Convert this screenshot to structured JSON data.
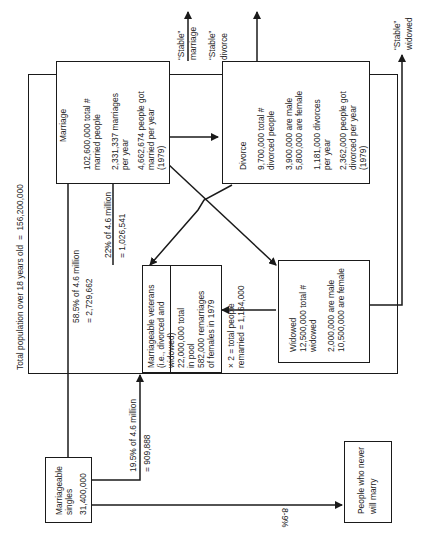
{
  "diagram": {
    "outer_label": "Total population over 18 years old  =  156,200,000",
    "stable": {
      "marriage": [
        "“Stable”",
        "marriage"
      ],
      "divorce": [
        "“Stable”",
        "divorce"
      ],
      "widowed": [
        "“Stable”",
        "widowed"
      ]
    },
    "marriage_box": {
      "title": "Marriage",
      "lines": [
        "102,600,000 total #",
        "married people",
        "2,331,337 marriages",
        "per year",
        "4,662,674 people got",
        "married per year",
        "(1979)"
      ]
    },
    "divorce_box": {
      "title": "Divorce",
      "lines": [
        "9,700,000 total #",
        "divorced people",
        "3,900,000 are male",
        "5,800,000 are female",
        "1,181,000 divorces",
        "per year",
        "2,362,000 people got",
        "divorced per year",
        "(1979)"
      ]
    },
    "veterans_box": {
      "title": "Marriageable veterans",
      "lines": [
        "(i.e., divorced and",
        "widowed)",
        "22,000,000 total",
        "in pool",
        "582,000 remarriages",
        "of females in 1979",
        "× 2 = total people",
        "remarried = 1,164,000"
      ]
    },
    "widowed_box": {
      "title": "Widowed",
      "lines": [
        "12,500,000 total #",
        "widowed",
        "2,000,000 are male",
        "10,500,000 are female"
      ]
    },
    "singles_box": {
      "lines": [
        "Marriageable",
        "singles",
        "31,400,000"
      ]
    },
    "never_box": {
      "lines": [
        "People who never",
        "will marry"
      ]
    },
    "flows": {
      "singles_to_marriage": [
        "58.5% of 4.6 million",
        "= 2,729,662"
      ],
      "singles_to_veterans": [
        "19.5% of 4.6 million",
        "= 909,888"
      ],
      "veterans_to_marriage": [
        "22% of 4.6 million",
        "= 1,026,541"
      ],
      "singles_to_never": "8-9%"
    }
  }
}
